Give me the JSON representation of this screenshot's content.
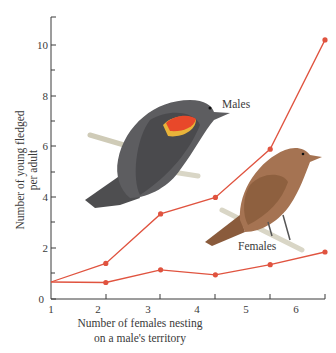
{
  "chart_data": {
    "type": "line",
    "title": "",
    "xlabel": "Number of females nesting on a male's territory",
    "xlabel_lines": [
      "Number of females nesting",
      "on a male's territory"
    ],
    "ylabel": "Number of young fledged per adult",
    "ylabel_lines": [
      "Number of young fledged",
      "per adult"
    ],
    "x": [
      1,
      2,
      3,
      4,
      5,
      6
    ],
    "x_ticks": [
      "1",
      "2",
      "3",
      "4",
      "5",
      "6"
    ],
    "y_ticks": [
      "0",
      "2",
      "4",
      "6",
      "8",
      "10"
    ],
    "ylim": [
      0,
      11
    ],
    "xlim": [
      1,
      6
    ],
    "grid": false,
    "legend": "inline labels",
    "series": [
      {
        "name": "Males",
        "values": [
          0.67,
          1.4,
          3.35,
          4.0,
          5.9,
          10.2
        ],
        "color": "#e0533f"
      },
      {
        "name": "Females",
        "values": [
          0.67,
          0.65,
          1.15,
          0.95,
          1.35,
          1.85
        ],
        "color": "#e0533f"
      }
    ],
    "annotations": [
      "Males",
      "Females",
      "illustration: male red-winged blackbird",
      "illustration: female red-winged blackbird"
    ]
  },
  "colors": {
    "line": "#e0533f",
    "axis": "#3a3a3a",
    "male_bird_body": "#5a5a5c",
    "male_epaulet_red": "#e8482a",
    "male_epaulet_yellow": "#e9b43a",
    "female_bird_body": "#9a6a48",
    "perch": "#d9d6c6"
  }
}
